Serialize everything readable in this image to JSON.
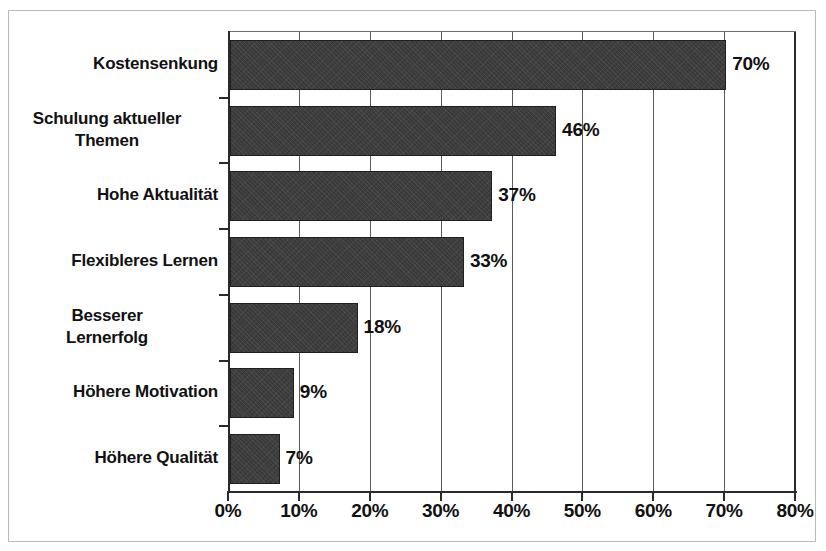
{
  "chart_data": {
    "type": "bar",
    "orientation": "horizontal",
    "title": "",
    "subtitle": "",
    "xlabel": "",
    "ylabel": "",
    "categories": [
      "Kostensenkung",
      "Schulung aktueller\nThemen",
      "Hohe Aktualität",
      "Flexibleres Lernen",
      "Besserer\nLernerfolg",
      "Höhere Motivation",
      "Höhere Qualität"
    ],
    "values": [
      70,
      46,
      37,
      33,
      18,
      9,
      7
    ],
    "value_labels": [
      "70%",
      "46%",
      "37%",
      "33%",
      "18%",
      "9%",
      "7%"
    ],
    "xlim": [
      0,
      80
    ],
    "xticks": [
      0,
      10,
      20,
      30,
      40,
      50,
      60,
      70,
      80
    ],
    "xtick_labels": [
      "0%",
      "10%",
      "20%",
      "30%",
      "40%",
      "50%",
      "60%",
      "70%",
      "80%"
    ],
    "grid": "vertical",
    "legend": "none",
    "bar_color": "#3a3a3a",
    "axis_color": "#2a2a2a",
    "gridline_color": "#5a5a5a",
    "background_color": "#ffffff",
    "frame_color": "#b9b9b9"
  }
}
